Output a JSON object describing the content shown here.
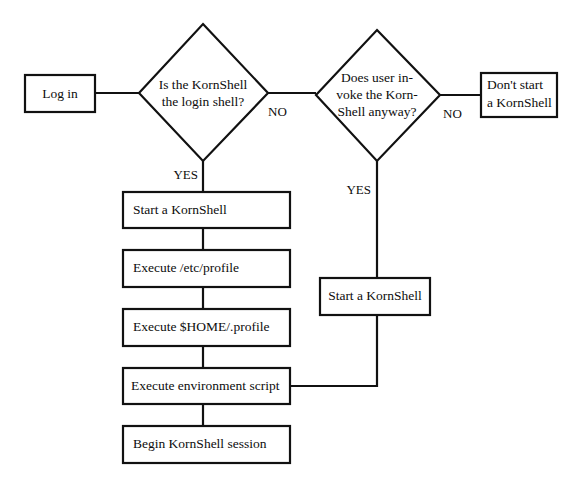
{
  "diagram": {
    "colors": {
      "stroke": "#111111",
      "fill": "#ffffff",
      "text": "#0d0d0d",
      "background": "#ffffff"
    },
    "nodes": {
      "login": {
        "label": "Log in",
        "shape": "process-box"
      },
      "decision_login_shell": {
        "line1": "Is the KornShell",
        "line2": "the login shell?",
        "shape": "decision-diamond"
      },
      "decision_invoke_anyway": {
        "line1": "Does user in-",
        "line2": "voke the Korn-",
        "line3": "Shell anyway?",
        "shape": "decision-diamond"
      },
      "dont_start": {
        "line1": "Don't start",
        "line2": "a KornShell",
        "shape": "process-box"
      },
      "start_kornshell_left": {
        "label": "Start a KornShell",
        "shape": "process-box"
      },
      "start_kornshell_right": {
        "label": "Start a KornShell",
        "shape": "process-box"
      },
      "execute_etc_profile": {
        "prefix": "Execute ",
        "emphasis": "/etc/profile",
        "shape": "process-box"
      },
      "execute_home_profile": {
        "prefix": "Execute ",
        "emphasis": "$HOME/.profile",
        "shape": "process-box"
      },
      "execute_env_script": {
        "label": "Execute environment script",
        "shape": "process-box"
      },
      "begin_session": {
        "label": "Begin KornShell session",
        "shape": "process-box"
      }
    },
    "edge_labels": {
      "login_shell_no": "NO",
      "login_shell_yes": "YES",
      "invoke_anyway_no": "NO",
      "invoke_anyway_yes": "YES"
    }
  }
}
